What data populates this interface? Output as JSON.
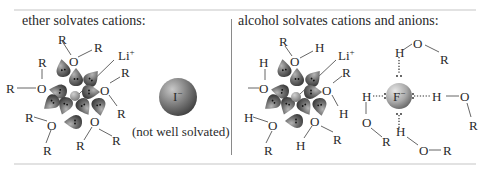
{
  "left_panel": {
    "heading": "ether solvates cations:",
    "cation_label": "Li",
    "cation_charge": "+",
    "anion_label": "I",
    "anion_charge": "−",
    "anion_caption": "(not well solvated)",
    "solvent_atoms": {
      "oxygen": "O",
      "alkyl": "R"
    }
  },
  "right_panel": {
    "heading": "alcohol solvates cations and anions:",
    "cation_label": "Li",
    "cation_charge": "+",
    "anion_label": "F",
    "anion_charge": "−",
    "solvent_atoms": {
      "oxygen": "O",
      "alkyl": "R",
      "hydrogen": "H"
    }
  },
  "colors": {
    "lobe": "#6e6e6e",
    "ion": "#8c8c8c",
    "line": "#555555",
    "rule": "#e2e2e2",
    "divider": "#8a8a8a"
  }
}
